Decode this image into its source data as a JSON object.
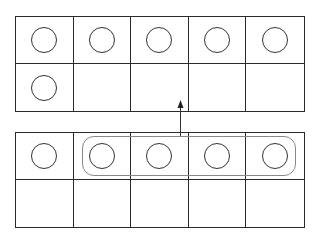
{
  "diagram": {
    "top_frame": {
      "cells": [
        1,
        1,
        1,
        1,
        1,
        1,
        0,
        0,
        0,
        0
      ],
      "count": 6
    },
    "bottom_frame": {
      "cells": [
        1,
        1,
        1,
        1,
        1,
        0,
        0,
        0,
        0,
        0
      ],
      "count": 5,
      "circled_group": {
        "start_index": 1,
        "end_index": 4,
        "size": 4
      }
    },
    "arrow": {
      "from": "bottom-frame-circled-group",
      "to": "top-frame",
      "direction": "up"
    },
    "colors": {
      "lines": "#2a2a2a",
      "group_outline": "#888888",
      "background": "#ffffff"
    }
  }
}
